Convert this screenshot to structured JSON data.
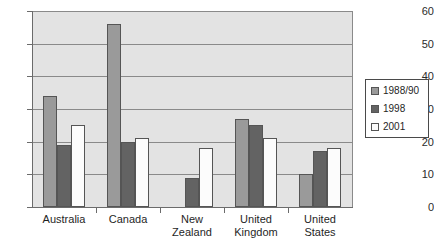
{
  "chart_data": {
    "type": "bar",
    "title": "",
    "subtitle": "",
    "xlabel": "",
    "ylabel": "",
    "ylim": [
      0,
      60
    ],
    "ytick_values": [
      0,
      10,
      20,
      30,
      40,
      50,
      60
    ],
    "ytick_labels": [
      "0",
      "10",
      "20",
      "30",
      "40",
      "50",
      "60"
    ],
    "grid": true,
    "grid_orientation": "horizontal",
    "legend_position": "right",
    "categories": [
      "Australia",
      "Canada",
      "New Zealand",
      "United Kingdom",
      "United States"
    ],
    "category_label_lines": [
      [
        "Australia"
      ],
      [
        "Canada"
      ],
      [
        "New",
        "Zealand"
      ],
      [
        "United",
        "Kingdom"
      ],
      [
        "United",
        "States"
      ]
    ],
    "series": [
      {
        "name": "1988/90",
        "color": "#9a9a9a",
        "values": [
          34,
          56,
          null,
          27,
          10
        ]
      },
      {
        "name": "1998",
        "color": "#636363",
        "values": [
          19,
          20,
          9,
          25,
          17
        ]
      },
      {
        "name": "2001",
        "color": "#fcfcfc",
        "values": [
          25,
          21,
          18,
          21,
          18
        ]
      }
    ]
  },
  "legend": {
    "entries": [
      {
        "label": "1988/90"
      },
      {
        "label": "1998"
      },
      {
        "label": "2001"
      }
    ]
  },
  "colors": {
    "plot_background": "#e3e3e3",
    "gridline": "#8a8a8a",
    "axis": "#6b6b6b",
    "bar_border": "#555555",
    "page_background": "#ffffff",
    "text": "#1f1f1f"
  }
}
